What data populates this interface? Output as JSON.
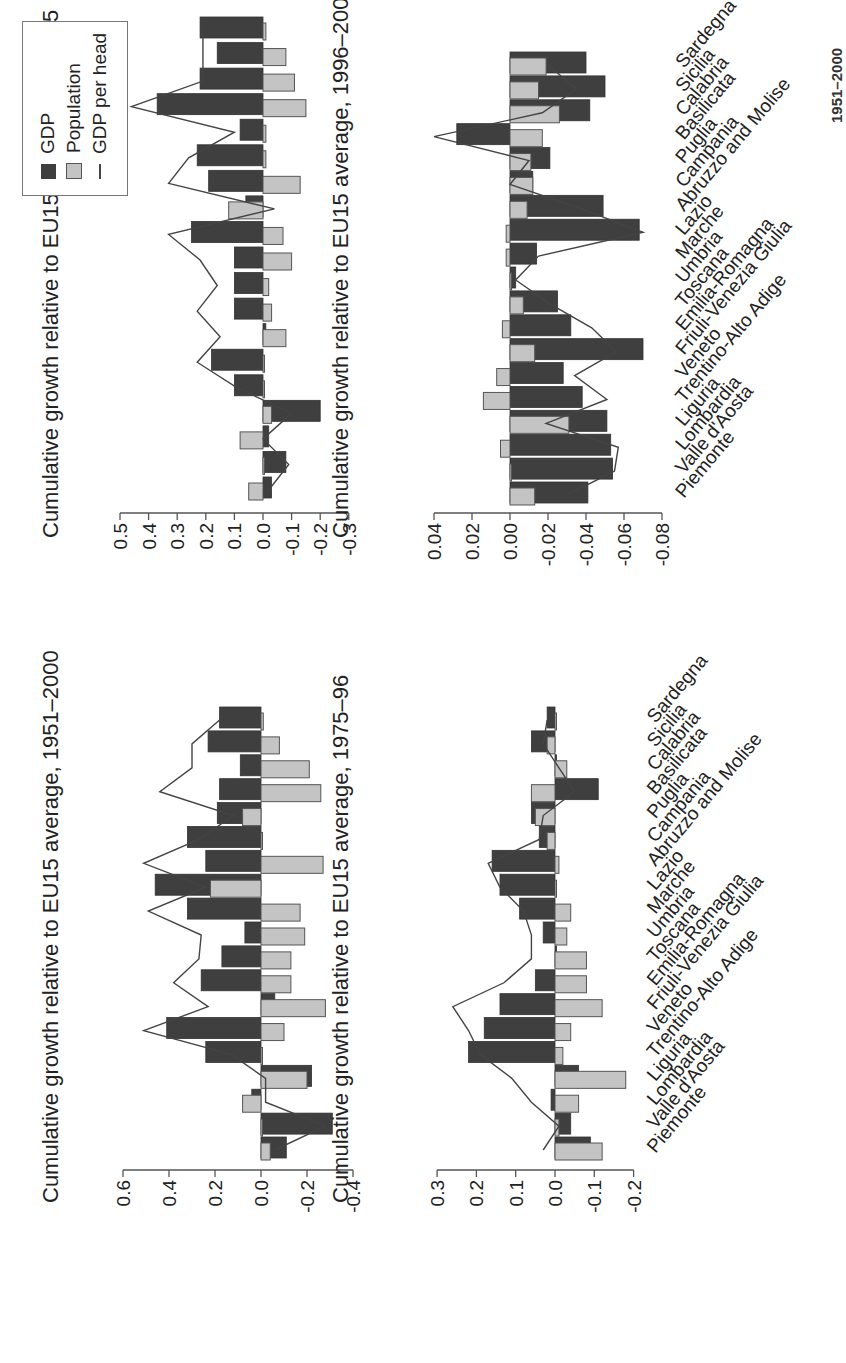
{
  "colors": {
    "gdp": "#3f3f3f",
    "population": "#c4c4c4",
    "line": "#444444",
    "axis": "#555555"
  },
  "legend": {
    "items": [
      {
        "label": "GDP",
        "type": "dark-bar"
      },
      {
        "label": "Population",
        "type": "light-bar"
      },
      {
        "label": "GDP per head",
        "type": "line"
      }
    ]
  },
  "caption_partial": "1951–2000",
  "regions": [
    "Piemonte",
    "Valle d'Aosta",
    "Lombardia",
    "Liguria",
    "Trentino-Alto Adige",
    "Veneto",
    "Friuli-Venezia Giulia",
    "Emilia-Romagna",
    "Toscana",
    "Umbria",
    "Marche",
    "Lazio",
    "Abruzzo and Molise",
    "Campania",
    "Puglia",
    "Basilicata",
    "Calabria",
    "Sicilia",
    "Sardegna"
  ],
  "chart_data": [
    {
      "type": "bar",
      "title": "Cumulative growth relative to EU15 average, 1951–2000",
      "ylim": [
        -0.4,
        0.6
      ],
      "yticks": [
        "0.6",
        "0.4",
        "0.2",
        "0.0",
        "-0.2",
        "-0.4"
      ],
      "categories": [
        "Piemonte",
        "Valle d'Aosta",
        "Lombardia",
        "Liguria",
        "Trentino-Alto Adige",
        "Veneto",
        "Friuli-Venezia Giulia",
        "Emilia-Romagna",
        "Toscana",
        "Umbria",
        "Marche",
        "Lazio",
        "Abruzzo and Molise",
        "Campania",
        "Puglia",
        "Basilicata",
        "Calabria",
        "Sicilia",
        "Sardegna"
      ],
      "series": [
        {
          "name": "GDP",
          "values": [
            -0.11,
            -0.31,
            0.04,
            -0.22,
            0.24,
            0.41,
            -0.06,
            0.26,
            0.17,
            0.07,
            0.32,
            0.46,
            0.24,
            0.32,
            0.19,
            0.18,
            0.09,
            0.23,
            0.18
          ]
        },
        {
          "name": "Population",
          "values": [
            -0.04,
            0.0,
            0.08,
            -0.2,
            0.0,
            -0.1,
            -0.28,
            -0.13,
            -0.13,
            -0.19,
            -0.17,
            0.22,
            -0.27,
            0.0,
            0.08,
            -0.26,
            -0.21,
            -0.08,
            -0.01
          ]
        },
        {
          "name": "GDP per head",
          "values": [
            -0.06,
            -0.28,
            -0.02,
            -0.02,
            0.13,
            0.51,
            0.23,
            0.38,
            0.27,
            0.26,
            0.49,
            0.24,
            0.51,
            0.27,
            0.12,
            0.44,
            0.3,
            0.3,
            0.18
          ]
        }
      ]
    },
    {
      "type": "bar",
      "title": "Cumulative growth relative to EU15 average, 1960–75",
      "ylim": [
        -0.3,
        0.5
      ],
      "yticks": [
        "0.5",
        "0.4",
        "0.3",
        "0.2",
        "0.1",
        "0.0",
        "-0.1",
        "-0.2",
        "-0.3"
      ],
      "categories": [
        "Piemonte",
        "Valle d'Aosta",
        "Lombardia",
        "Liguria",
        "Trentino-Alto Adige",
        "Veneto",
        "Friuli-Venezia Giulia",
        "Emilia-Romagna",
        "Toscana",
        "Umbria",
        "Marche",
        "Lazio",
        "Abruzzo and Molise",
        "Campania",
        "Puglia",
        "Basilicata",
        "Calabria",
        "Sicilia",
        "Sardegna"
      ],
      "series": [
        {
          "name": "GDP",
          "values": [
            -0.03,
            -0.08,
            -0.02,
            -0.2,
            0.1,
            0.18,
            -0.01,
            0.1,
            0.1,
            0.1,
            0.25,
            0.06,
            0.19,
            0.23,
            0.08,
            0.37,
            0.22,
            0.16,
            0.22
          ]
        },
        {
          "name": "Population",
          "values": [
            0.05,
            0.0,
            0.08,
            -0.03,
            0.0,
            0.0,
            -0.08,
            -0.03,
            -0.02,
            -0.1,
            -0.07,
            0.12,
            -0.13,
            -0.01,
            -0.01,
            -0.15,
            -0.11,
            -0.08,
            -0.01
          ]
        },
        {
          "name": "GDP per head",
          "values": [
            -0.02,
            -0.09,
            0.0,
            -0.1,
            0.09,
            0.23,
            0.15,
            0.23,
            0.16,
            0.22,
            0.33,
            -0.04,
            0.33,
            0.26,
            0.1,
            0.46,
            0.21,
            0.21,
            0.21
          ]
        }
      ]
    },
    {
      "type": "bar",
      "title": "Cumulative growth relative to EU15 average, 1975–96",
      "ylim": [
        -0.2,
        0.3
      ],
      "yticks": [
        "0.3",
        "0.2",
        "0.1",
        "0.0",
        "-0.1",
        "-0.2"
      ],
      "categories": [
        "Piemonte",
        "Valle d'Aosta",
        "Lombardia",
        "Liguria",
        "Trentino-Alto Adige",
        "Veneto",
        "Friuli-Venezia Giulia",
        "Emilia-Romagna",
        "Toscana",
        "Umbria",
        "Marche",
        "Lazio",
        "Abruzzo and Molise",
        "Campania",
        "Puglia",
        "Basilicata",
        "Calabria",
        "Sicilia",
        "Sardegna"
      ],
      "series": [
        {
          "name": "GDP",
          "values": [
            -0.09,
            -0.04,
            0.01,
            -0.06,
            0.22,
            0.18,
            0.14,
            0.05,
            0.0,
            0.03,
            0.09,
            0.14,
            0.16,
            0.04,
            0.06,
            -0.11,
            0.0,
            0.06,
            0.02
          ]
        },
        {
          "name": "Population",
          "values": [
            -0.12,
            -0.01,
            -0.06,
            -0.18,
            -0.02,
            -0.04,
            -0.12,
            -0.08,
            -0.08,
            -0.03,
            -0.04,
            0.0,
            -0.01,
            0.02,
            0.05,
            0.06,
            -0.03,
            0.02,
            0.0
          ]
        },
        {
          "name": "GDP per head",
          "values": [
            0.03,
            -0.01,
            0.06,
            0.11,
            0.19,
            0.22,
            0.26,
            0.13,
            0.06,
            0.06,
            0.08,
            0.14,
            0.17,
            0.04,
            0.03,
            -0.05,
            -0.01,
            0.03,
            0.02
          ]
        }
      ]
    },
    {
      "type": "bar",
      "title": "Cumulative growth relative to EU15 average, 1996–2000",
      "ylim": [
        -0.08,
        0.04
      ],
      "yticks": [
        "0.04",
        "0.02",
        "0.00",
        "-0.02",
        "-0.04",
        "-0.06",
        "-0.08"
      ],
      "categories": [
        "Piemonte",
        "Valle d'Aosta",
        "Lombardia",
        "Liguria",
        "Trentino-Alto Adige",
        "Veneto",
        "Friuli-Venezia Giulia",
        "Emilia-Romagna",
        "Toscana",
        "Umbria",
        "Marche",
        "Lazio",
        "Abruzzo and Molise",
        "Campania",
        "Puglia",
        "Basilicata",
        "Calabria",
        "Sicilia",
        "Sardegna"
      ],
      "series": [
        {
          "name": "GDP",
          "values": [
            -0.041,
            -0.054,
            -0.053,
            -0.051,
            -0.038,
            -0.028,
            -0.07,
            -0.032,
            -0.025,
            -0.003,
            -0.014,
            -0.068,
            -0.049,
            -0.012,
            -0.021,
            0.028,
            -0.042,
            -0.05,
            -0.04
          ]
        },
        {
          "name": "Population",
          "values": [
            -0.013,
            0.0,
            0.005,
            -0.031,
            0.014,
            0.007,
            -0.013,
            0.004,
            -0.007,
            0.0,
            0.002,
            0.002,
            -0.009,
            -0.012,
            -0.011,
            -0.017,
            -0.026,
            -0.015,
            -0.019
          ]
        },
        {
          "name": "GDP per head",
          "values": [
            -0.03,
            -0.055,
            -0.057,
            -0.019,
            -0.051,
            -0.034,
            -0.056,
            -0.043,
            -0.021,
            -0.003,
            -0.015,
            -0.07,
            -0.037,
            0.0,
            -0.01,
            0.04,
            -0.017,
            -0.035,
            -0.02
          ]
        }
      ]
    }
  ]
}
